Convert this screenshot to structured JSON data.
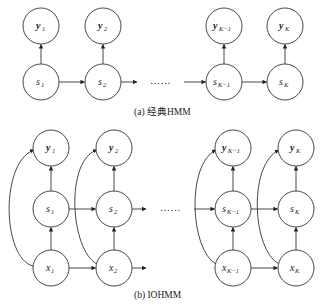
{
  "panels": [
    {
      "id": "a",
      "caption": "(a) 经典HMM",
      "ellipsis": "……",
      "columns": [
        {
          "x": 41,
          "nodes": [
            {
              "role": "y",
              "base": "y",
              "sub": "1",
              "cy": 26
            },
            {
              "role": "s",
              "base": "s",
              "sub": "1",
              "cy": 82
            }
          ]
        },
        {
          "x": 103,
          "nodes": [
            {
              "role": "y",
              "base": "y",
              "sub": "2",
              "cy": 26
            },
            {
              "role": "s",
              "base": "s",
              "sub": "2",
              "cy": 82
            }
          ]
        },
        {
          "x": 224,
          "nodes": [
            {
              "role": "y",
              "base": "y",
              "sub": "K−1",
              "cy": 26
            },
            {
              "role": "s",
              "base": "s",
              "sub": "K−1",
              "cy": 82
            }
          ]
        },
        {
          "x": 285,
          "nodes": [
            {
              "role": "y",
              "base": "y",
              "sub": "K",
              "cy": 26
            },
            {
              "role": "s",
              "base": "s",
              "sub": "K",
              "cy": 82
            }
          ]
        }
      ]
    },
    {
      "id": "b",
      "caption": "(b) IOHMM",
      "ellipsis": "……",
      "columns": [
        {
          "x": 51,
          "nodes": [
            {
              "role": "y",
              "base": "y",
              "sub": "1",
              "cy": 148
            },
            {
              "role": "s",
              "base": "s",
              "sub": "1",
              "cy": 209
            },
            {
              "role": "x",
              "base": "x",
              "sub": "1",
              "cy": 268
            }
          ]
        },
        {
          "x": 114,
          "nodes": [
            {
              "role": "y",
              "base": "y",
              "sub": "2",
              "cy": 148
            },
            {
              "role": "s",
              "base": "s",
              "sub": "2",
              "cy": 209
            },
            {
              "role": "x",
              "base": "x",
              "sub": "2",
              "cy": 268
            }
          ]
        },
        {
          "x": 233,
          "nodes": [
            {
              "role": "y",
              "base": "y",
              "sub": "K−1",
              "cy": 148
            },
            {
              "role": "s",
              "base": "s",
              "sub": "K−1",
              "cy": 209
            },
            {
              "role": "x",
              "base": "x",
              "sub": "K−1",
              "cy": 268
            }
          ]
        },
        {
          "x": 296,
          "nodes": [
            {
              "role": "y",
              "base": "y",
              "sub": "K",
              "cy": 148
            },
            {
              "role": "s",
              "base": "s",
              "sub": "K",
              "cy": 209
            },
            {
              "role": "x",
              "base": "x",
              "sub": "K",
              "cy": 268
            }
          ]
        }
      ]
    }
  ],
  "style": {
    "stroke": "#333333",
    "fill": "#ffffff",
    "radius": 18
  }
}
